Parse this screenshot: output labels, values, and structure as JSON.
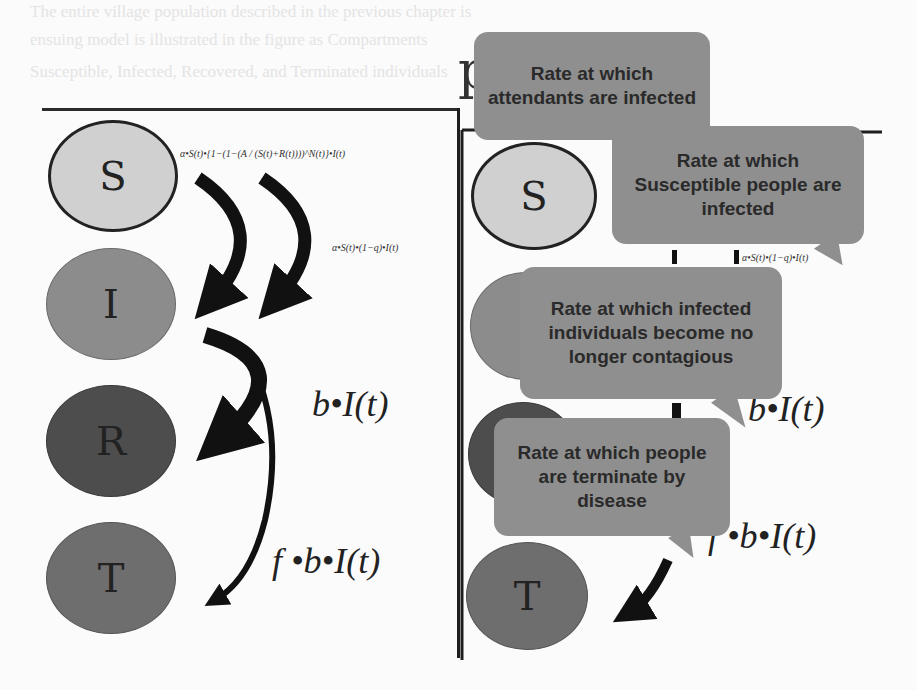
{
  "background_text": [
    "The entire village population described in the previous chapter is",
    "ensuing model is illustrated in the figure as Compartments",
    "Susceptible, Infected, Recovered, and Terminated individuals"
  ],
  "heading_fragment": "p",
  "left_panel": {
    "nodes": [
      {
        "id": "S",
        "label": "S"
      },
      {
        "id": "I",
        "label": "I"
      },
      {
        "id": "R",
        "label": "R"
      },
      {
        "id": "T",
        "label": "T"
      }
    ],
    "formulas": {
      "attendant_infection": "α•S(t)•{1−(1−(A / (S(t)+R(t))))^N(t)}•I(t)",
      "susceptible_infection": "α•S(t)•(1−q)•I(t)",
      "recovery": "b•I(t)",
      "termination": "f •b•I(t)"
    }
  },
  "right_panel": {
    "nodes": [
      {
        "id": "S",
        "label": "S"
      },
      {
        "id": "T",
        "label": "T"
      }
    ],
    "formulas": {
      "recovery": "b•I(t)",
      "termination": "f •b•I(t)",
      "susceptible_infection_partial": "α•S(t)•(1−q)•I(t)"
    },
    "callouts": [
      {
        "id": "attendants",
        "text": "Rate at which attendants are infected"
      },
      {
        "id": "susceptible",
        "text": "Rate at which Susceptible people are infected"
      },
      {
        "id": "recovery",
        "text": "Rate at which infected individuals become no longer contagious"
      },
      {
        "id": "termination",
        "text": "Rate at which people are terminate by disease"
      }
    ]
  },
  "colors": {
    "node_S": "#d0d0d0",
    "node_I": "#8c8c8c",
    "node_R": "#4d4d4d",
    "node_T": "#6e6e6e",
    "callout": "#8f8f8f",
    "arrow": "#111111"
  }
}
